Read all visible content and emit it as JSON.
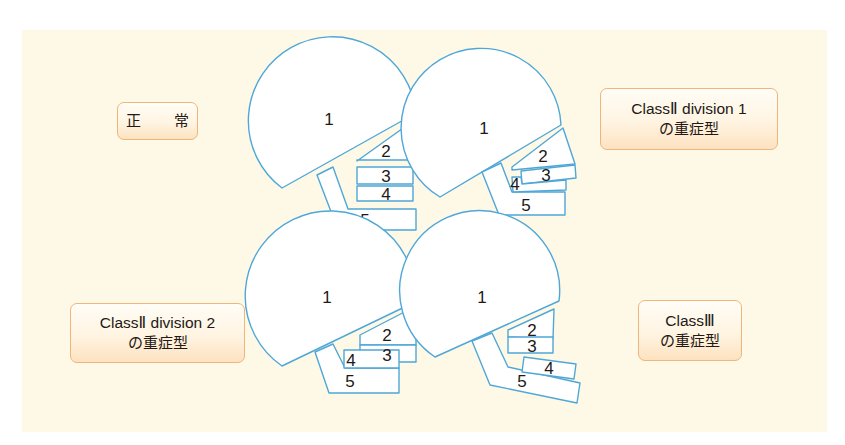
{
  "figure": {
    "background_color": "#fdf9e6",
    "outline_color": "#4fa7d8",
    "label_border_color": "#efb57a",
    "labels": {
      "normal": {
        "line1": "正 常"
      },
      "class2_div1": {
        "line1": "ClassⅡ division 1",
        "line2": "の重症型"
      },
      "class2_div2": {
        "line1": "ClassⅡ division 2",
        "line2": "の重症型"
      },
      "class3": {
        "line1": "ClassⅢ",
        "line2": "の重症型"
      }
    },
    "diagrams": [
      {
        "name": "normal",
        "parts": [
          "1",
          "2",
          "3",
          "4",
          "5"
        ]
      },
      {
        "name": "class2_div1",
        "parts": [
          "1",
          "2",
          "3",
          "4",
          "5"
        ]
      },
      {
        "name": "class2_div2",
        "parts": [
          "1",
          "2",
          "3",
          "4",
          "5"
        ]
      },
      {
        "name": "class3",
        "parts": [
          "1",
          "2",
          "3",
          "4",
          "5"
        ]
      }
    ]
  }
}
